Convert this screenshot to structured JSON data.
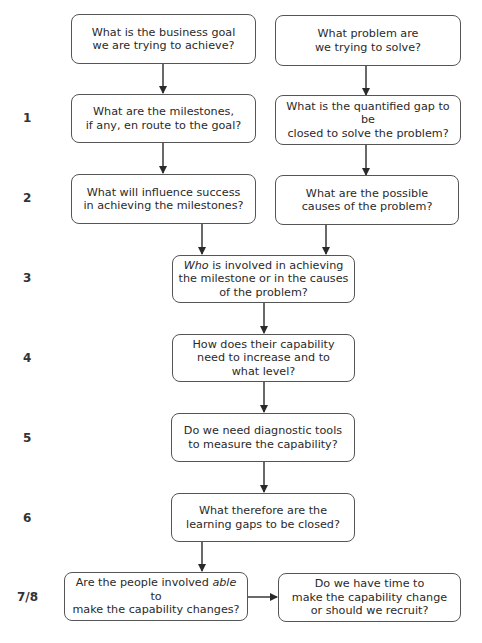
{
  "diagram": {
    "type": "flowchart",
    "step_labels": [
      "1",
      "2",
      "3",
      "4",
      "5",
      "6",
      "7/8"
    ],
    "nodes": {
      "business_goal": {
        "lines": [
          "What is the business goal",
          "we are trying to achieve?"
        ]
      },
      "problem": {
        "lines": [
          "What problem are",
          "we trying to solve?"
        ]
      },
      "milestones": {
        "lines": [
          "What are the milestones,",
          "if any, en route to the goal?"
        ]
      },
      "quantified_gap": {
        "lines": [
          "What is the quantified gap to be",
          "closed to solve the problem?"
        ]
      },
      "influence_success": {
        "lines": [
          "What will influence success",
          "in achieving the milestones?"
        ]
      },
      "possible_causes": {
        "lines": [
          "What are the possible",
          "causes of the problem?"
        ]
      },
      "who_involved": {
        "italic": "Who",
        "line1_rest": " is involved in achieving",
        "lines": [
          "the milestone or in the causes",
          "of the problem?"
        ]
      },
      "capability_increase": {
        "lines": [
          "How does their capability",
          "need to increase and to",
          "what level?"
        ]
      },
      "diagnostic_tools": {
        "lines": [
          "Do we need diagnostic tools",
          "to measure the capability?"
        ]
      },
      "learning_gaps": {
        "lines": [
          "What therefore are the",
          "learning gaps to be closed?"
        ]
      },
      "able_to_change": {
        "line1_pre": "Are the people involved ",
        "italic": "able",
        "line1_post": " to",
        "lines": [
          "make the capability changes?"
        ]
      },
      "time_or_recruit": {
        "lines": [
          "Do we have time to",
          "make the capability change",
          "or should we recruit?"
        ]
      }
    },
    "edges": [
      [
        "business_goal",
        "milestones"
      ],
      [
        "problem",
        "quantified_gap"
      ],
      [
        "milestones",
        "influence_success"
      ],
      [
        "quantified_gap",
        "possible_causes"
      ],
      [
        "influence_success",
        "who_involved"
      ],
      [
        "possible_causes",
        "who_involved"
      ],
      [
        "who_involved",
        "capability_increase"
      ],
      [
        "capability_increase",
        "diagnostic_tools"
      ],
      [
        "diagnostic_tools",
        "learning_gaps"
      ],
      [
        "learning_gaps",
        "able_to_change"
      ],
      [
        "able_to_change",
        "time_or_recruit"
      ]
    ]
  }
}
